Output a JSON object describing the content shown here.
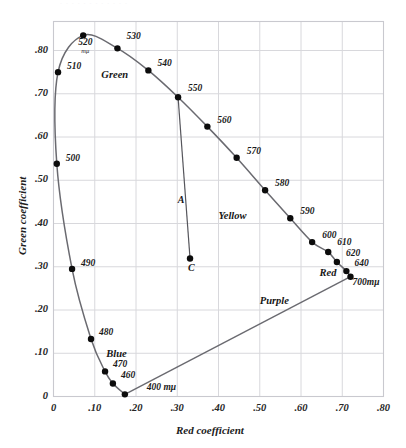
{
  "figure": {
    "top_bleed_text": "· · · · · · · · · · · ·",
    "xlabel": "Red coefficient",
    "ylabel": "Green coefficient"
  },
  "axes": {
    "x_ticks": [
      "0",
      ".10",
      ".20",
      ".30",
      ".40",
      ".50",
      ".60",
      ".70",
      ".80"
    ],
    "y_ticks": [
      "0",
      ".10",
      ".20",
      ".30",
      ".40",
      ".50",
      ".60",
      ".70",
      ".80"
    ],
    "x_tick_values": [
      0,
      0.1,
      0.2,
      0.3,
      0.4,
      0.5,
      0.6,
      0.7,
      0.8
    ],
    "y_tick_values": [
      0,
      0.1,
      0.2,
      0.3,
      0.4,
      0.5,
      0.6,
      0.7,
      0.8
    ],
    "xlim": [
      0,
      0.8
    ],
    "ylim": [
      0,
      0.8
    ],
    "grid": true,
    "grid_color": "#d8d8dc",
    "frame_color": "#c9c9cf"
  },
  "chart_data": {
    "type": "line",
    "title": "",
    "xlabel": "Red coefficient",
    "ylabel": "Green coefficient",
    "xlim": [
      0,
      0.8
    ],
    "ylim": [
      0,
      0.8
    ],
    "grid": true,
    "legend": "none",
    "series": [
      {
        "name": "Spectral locus (CIE 1931 x,y chromaticity)",
        "curve_color": "#6a6a70",
        "points": [
          {
            "label": "400 mμ",
            "wavelength": 400,
            "x": 0.173,
            "y": 0.005,
            "label_dx": 22,
            "label_dy": 0
          },
          {
            "label": "460",
            "wavelength": 460,
            "x": 0.144,
            "y": 0.03,
            "label_dx": 8,
            "label_dy": -8
          },
          {
            "label": "470",
            "wavelength": 470,
            "x": 0.125,
            "y": 0.058,
            "label_dx": 8,
            "label_dy": -6
          },
          {
            "label": "480",
            "wavelength": 480,
            "x": 0.091,
            "y": 0.133,
            "label_dx": 8,
            "label_dy": -6
          },
          {
            "label": "490",
            "wavelength": 490,
            "x": 0.045,
            "y": 0.295,
            "label_dx": 9,
            "label_dy": -5
          },
          {
            "label": "500",
            "wavelength": 500,
            "x": 0.008,
            "y": 0.538,
            "label_dx": 9,
            "label_dy": -5
          },
          {
            "label": "510",
            "wavelength": 510,
            "x": 0.011,
            "y": 0.75,
            "label_dx": 9,
            "label_dy": -5
          },
          {
            "label": "520",
            "wavelength": 520,
            "x": 0.072,
            "y": 0.835,
            "label_dx": -5,
            "label_dy": 8
          },
          {
            "label": "530",
            "wavelength": 530,
            "x": 0.155,
            "y": 0.805,
            "label_dx": 9,
            "label_dy": -11
          },
          {
            "label": "540",
            "wavelength": 540,
            "x": 0.23,
            "y": 0.754,
            "label_dx": 9,
            "label_dy": -6
          },
          {
            "label": "550",
            "wavelength": 550,
            "x": 0.302,
            "y": 0.692,
            "label_dx": 10,
            "label_dy": -8
          },
          {
            "label": "560",
            "wavelength": 560,
            "x": 0.373,
            "y": 0.624,
            "label_dx": 10,
            "label_dy": -6
          },
          {
            "label": "570",
            "wavelength": 570,
            "x": 0.444,
            "y": 0.552,
            "label_dx": 10,
            "label_dy": -6
          },
          {
            "label": "580",
            "wavelength": 580,
            "x": 0.513,
            "y": 0.477,
            "label_dx": 10,
            "label_dy": -6
          },
          {
            "label": "590",
            "wavelength": 590,
            "x": 0.574,
            "y": 0.412,
            "label_dx": 10,
            "label_dy": -6
          },
          {
            "label": "600",
            "wavelength": 600,
            "x": 0.627,
            "y": 0.357,
            "label_dx": 10,
            "label_dy": -6
          },
          {
            "label": "610",
            "wavelength": 610,
            "x": 0.666,
            "y": 0.334,
            "label_dx": 9,
            "label_dy": -9
          },
          {
            "label": "620",
            "wavelength": 620,
            "x": 0.687,
            "y": 0.311,
            "label_dx": 9,
            "label_dy": -8
          },
          {
            "label": "640",
            "wavelength": 640,
            "x": 0.71,
            "y": 0.29,
            "label_dx": 8,
            "label_dy": -7
          },
          {
            "label": "700mμ",
            "wavelength": 700,
            "x": 0.72,
            "y": 0.277,
            "label_dx": 2,
            "label_dy": 6
          }
        ]
      },
      {
        "name": "Purple line (400 mμ to 700 mμ)",
        "curve_color": "#6a6a70",
        "points": [
          {
            "x": 0.173,
            "y": 0.005
          },
          {
            "x": 0.72,
            "y": 0.277
          }
        ]
      },
      {
        "name": "Dominant-wavelength line A–C (550 mμ to illuminant C)",
        "curve_color": "#55555b",
        "points": [
          {
            "x": 0.302,
            "y": 0.692
          },
          {
            "x": 0.331,
            "y": 0.319
          }
        ]
      }
    ],
    "annotated_points": [
      {
        "label": "C",
        "name": "illuminant-c",
        "x": 0.331,
        "y": 0.319,
        "label_dx": -2,
        "label_dy": 9
      },
      {
        "label": "A",
        "name": "line-a-label",
        "x": 0.323,
        "y": 0.455,
        "label_dx": -9,
        "label_dy": 0,
        "marker": false
      }
    ],
    "region_labels": [
      {
        "label": "Green",
        "x": 0.116,
        "y": 0.742
      },
      {
        "label": "Yellow",
        "x": 0.4,
        "y": 0.416
      },
      {
        "label": "Red",
        "x": 0.645,
        "y": 0.283
      },
      {
        "label": "Purple",
        "x": 0.5,
        "y": 0.218
      },
      {
        "label": "Blue",
        "x": 0.128,
        "y": 0.095
      }
    ]
  }
}
